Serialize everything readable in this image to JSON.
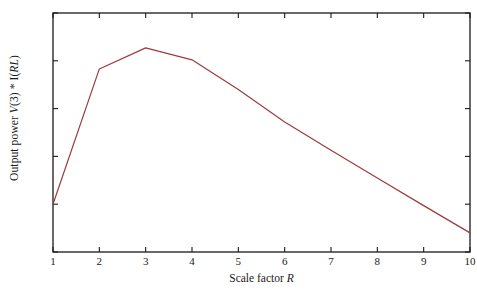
{
  "chart_data": {
    "type": "line",
    "title": "",
    "xlabel": "Scale factor R",
    "xlabel_plain": "Scale factor",
    "xlabel_italic": "R",
    "ylabel": "Output power  V(3) * I(RL)",
    "ylabel_prefix": "Output power  ",
    "ylabel_v": "V",
    "ylabel_mid": "(3) * I(",
    "ylabel_rl": "RL",
    "ylabel_suffix": ")",
    "x": [
      1,
      2,
      3,
      4,
      5,
      6,
      7,
      8,
      9,
      10
    ],
    "values": [
      1.0,
      1.283,
      1.327,
      1.302,
      1.24,
      1.172,
      1.113,
      1.055,
      0.997,
      0.94
    ],
    "series": [
      {
        "name": "Output power",
        "values": [
          1.0,
          1.283,
          1.327,
          1.302,
          1.24,
          1.172,
          1.113,
          1.055,
          0.997,
          0.94
        ]
      }
    ],
    "xlim": [
      1,
      10
    ],
    "ylim": [
      0.9,
      1.4
    ],
    "xticks": [
      1,
      2,
      3,
      4,
      5,
      6,
      7,
      8,
      9,
      10
    ],
    "xtick_labels": [
      "1",
      "2",
      "3",
      "4",
      "5",
      "6",
      "7",
      "8",
      "9",
      "10"
    ],
    "yticks": [
      0.9,
      1.0,
      1.1,
      1.2,
      1.3,
      1.4
    ],
    "ytick_labels": [
      "0.9 W",
      "1.0 W",
      "1.1 W",
      "1.2 W",
      "1.3 W",
      "1.4 W"
    ],
    "grid": false,
    "legend": "none",
    "line_color": "#9e3b3b",
    "axis_color": "#1a1a1a",
    "background": "#ffffff",
    "line_width": 1.2,
    "annotations": []
  }
}
